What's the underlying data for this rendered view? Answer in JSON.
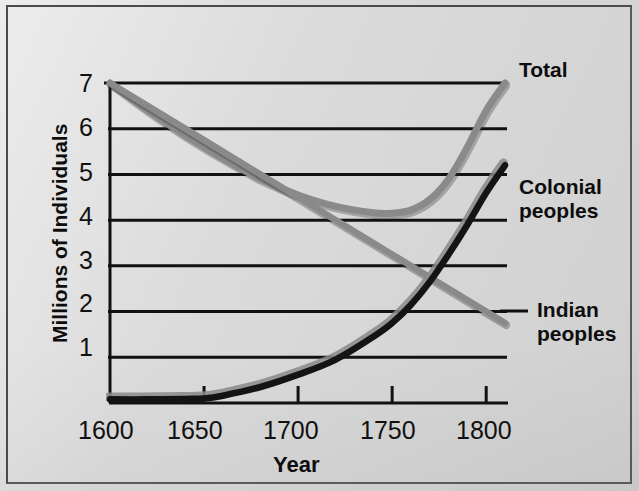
{
  "chart_data": {
    "type": "line",
    "title": "",
    "xlabel": "Year",
    "ylabel": "Millions of Individuals",
    "xlim": [
      1600,
      1810
    ],
    "ylim": [
      0,
      7.3
    ],
    "xticks": [
      1600,
      1650,
      1700,
      1750,
      1800
    ],
    "xticklabels": [
      "1600",
      "1650",
      "1700",
      "1750",
      "1800"
    ],
    "yticks": [
      1,
      2,
      3,
      4,
      5,
      6,
      7
    ],
    "yticklabels": [
      "1",
      "2",
      "3",
      "4",
      "5",
      "6",
      "7"
    ],
    "grid": "horizontal",
    "legend_position": "right-inline-annotations",
    "series": [
      {
        "name": "Total",
        "color": "#8c8c8c",
        "style": "thick gray curve",
        "x": [
          1600,
          1620,
          1640,
          1660,
          1680,
          1700,
          1720,
          1740,
          1750,
          1760,
          1770,
          1780,
          1790,
          1800,
          1810
        ],
        "values": [
          7.0,
          6.4,
          5.85,
          5.35,
          4.9,
          4.55,
          4.3,
          4.16,
          4.15,
          4.22,
          4.45,
          4.9,
          5.6,
          6.4,
          7.0
        ]
      },
      {
        "name": "Indian peoples",
        "color": "#8c8c8c",
        "style": "straight descending gray line",
        "x": [
          1600,
          1650,
          1700,
          1750,
          1800,
          1810
        ],
        "values": [
          7.0,
          5.75,
          4.5,
          3.25,
          2.0,
          1.75
        ]
      },
      {
        "name": "Colonial peoples",
        "color": "#111111",
        "style": "rising black curve",
        "x": [
          1600,
          1620,
          1640,
          1650,
          1660,
          1680,
          1700,
          1720,
          1740,
          1750,
          1760,
          1770,
          1780,
          1790,
          1800,
          1810
        ],
        "values": [
          0.08,
          0.08,
          0.09,
          0.1,
          0.16,
          0.35,
          0.62,
          0.95,
          1.45,
          1.75,
          2.15,
          2.65,
          3.25,
          3.9,
          4.6,
          5.2
        ]
      }
    ],
    "annotations": [
      {
        "text": "Total",
        "series": "Total",
        "at_x": 1810,
        "at_y": 7.0
      },
      {
        "text": "Colonial peoples",
        "series": "Colonial peoples",
        "at_x": 1810,
        "at_y": 5.2
      },
      {
        "text": "Indian peoples",
        "series": "Indian peoples",
        "at_x": 1810,
        "at_y": 1.75
      }
    ]
  },
  "axis": {
    "y_title": "Millions of Individuals",
    "x_title": "Year"
  },
  "labels": {
    "total": "Total",
    "colonial_line1": "Colonial",
    "colonial_line2": "peoples",
    "indian_line1": "Indian",
    "indian_line2": "peoples"
  },
  "ticks": {
    "y": [
      "7",
      "6",
      "5",
      "4",
      "3",
      "2",
      "1"
    ],
    "x": [
      "1600",
      "1650",
      "1700",
      "1750",
      "1800"
    ]
  },
  "colors": {
    "background": "#d6d6d6",
    "axis": "#111111",
    "gray_series": "#8c8c8c",
    "black_series": "#111111"
  }
}
